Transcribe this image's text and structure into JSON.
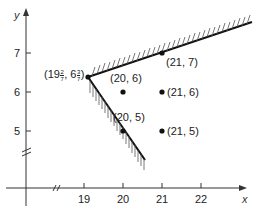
{
  "diagram": {
    "axes": {
      "x_label": "x",
      "y_label": "y",
      "x_ticks": [
        "19",
        "20",
        "21",
        "22"
      ],
      "y_ticks": [
        "7",
        "6",
        "5"
      ],
      "x_axis_break": "//",
      "y_axis_break": "//"
    },
    "vertex": {
      "label_prefix": "(19",
      "x_frac_num": "2",
      "x_frac_den": "7",
      "mid": ", 6",
      "y_frac_num": "3",
      "y_frac_den": "7",
      "suffix": ")"
    },
    "points": [
      {
        "label": "(20, 6)"
      },
      {
        "label": "(21, 7)"
      },
      {
        "label": "(21, 6)"
      },
      {
        "label": "(20, 5)"
      },
      {
        "label": "(21, 5)"
      }
    ],
    "constraints": [
      {
        "name": "upper-boundary",
        "shading": "above"
      },
      {
        "name": "lower-boundary",
        "shading": "below-left"
      }
    ]
  }
}
